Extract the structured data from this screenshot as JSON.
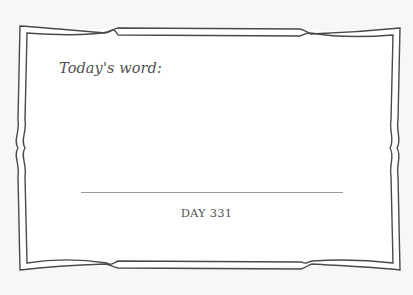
{
  "card": {
    "prompt_label": "Today's word:",
    "answer_value": "",
    "day_label": "DAY 331"
  },
  "colors": {
    "background": "#f7f7f7",
    "frame_fill": "#ffffff",
    "frame_stroke": "#4a4a4a",
    "text": "#505050",
    "line": "#9a9a9a"
  }
}
